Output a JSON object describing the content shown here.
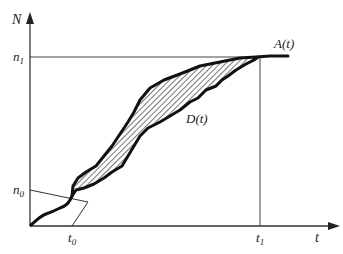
{
  "diagram": {
    "type": "cumulative arrival/departure curves",
    "axes": {
      "y_label": "N",
      "x_label": "t"
    },
    "y_ticks": [
      {
        "main": "n",
        "sub": "1"
      },
      {
        "main": "n",
        "sub": "0"
      }
    ],
    "x_ticks": [
      {
        "main": "t",
        "sub": "0"
      },
      {
        "main": "t",
        "sub": "1"
      }
    ],
    "curves": {
      "arrival": "A(t)",
      "departure": "D(t)"
    },
    "colors": {
      "line": "#111111",
      "axis": "#333333",
      "hatch": "#555555"
    }
  }
}
